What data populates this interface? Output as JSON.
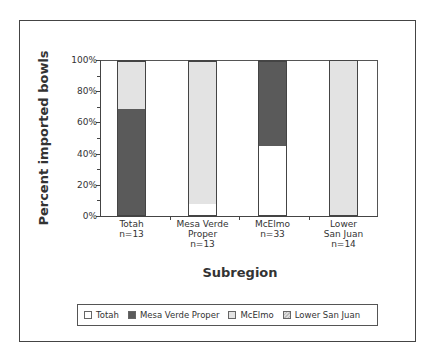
{
  "chart_data": {
    "type": "bar",
    "stacked": true,
    "title": "",
    "xlabel": "Subregion",
    "ylabel": "Percent imported bowls",
    "ylim": [
      0,
      100
    ],
    "yticks": [
      "0%",
      "20%",
      "40%",
      "60%",
      "80%",
      "100%"
    ],
    "categories": [
      "Totah\nn=13",
      "Mesa Verde\nProper\nn=13",
      "McElmo\nn=33",
      "Lower\nSan Juan\nn=14"
    ],
    "category_lines": [
      [
        "Totah",
        "n=13"
      ],
      [
        "Mesa Verde",
        "Proper",
        "n=13"
      ],
      [
        "McElmo",
        "n=33"
      ],
      [
        "Lower",
        "San Juan",
        "n=14"
      ]
    ],
    "series": [
      {
        "name": "Totah",
        "color": "#ffffff",
        "values": [
          0,
          7,
          45,
          0
        ]
      },
      {
        "name": "Mesa Verde Proper",
        "color": "#5a5a5a",
        "values": [
          69,
          0,
          55,
          0
        ]
      },
      {
        "name": "McElmo",
        "color": "#e3e3e3",
        "values": [
          31,
          93,
          0,
          0
        ]
      },
      {
        "name": "Lower San Juan",
        "color": "#e3e3e3",
        "pattern": "hatch",
        "values": [
          0,
          0,
          0,
          100
        ]
      }
    ],
    "legend": {
      "position": "bottom",
      "entries": [
        "Totah",
        "Mesa Verde Proper",
        "McElmo",
        "Lower San Juan"
      ]
    },
    "grid": false
  },
  "legend": {
    "items": [
      {
        "label": "Totah"
      },
      {
        "label": "Mesa Verde Proper"
      },
      {
        "label": "McElmo"
      },
      {
        "label": "Lower San Juan"
      }
    ]
  }
}
